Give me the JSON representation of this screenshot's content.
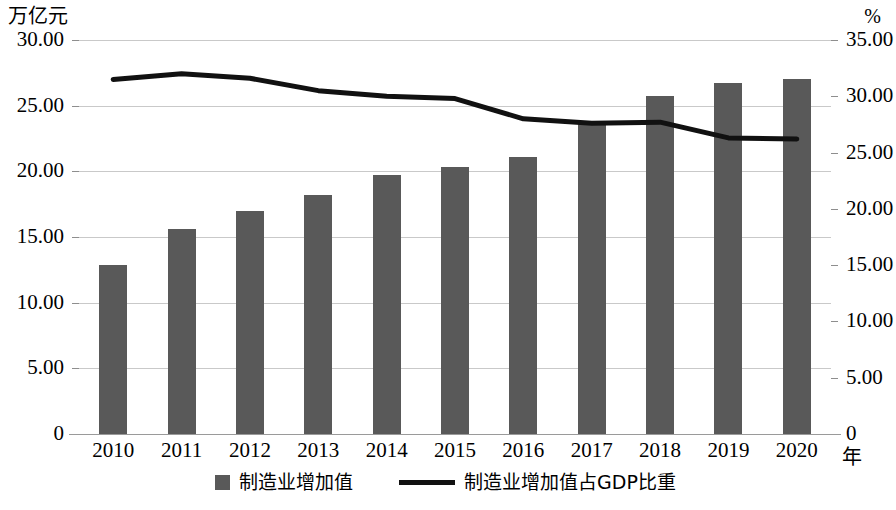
{
  "chart_data": {
    "type": "bar",
    "title": "",
    "subtitle": "",
    "xlabel": "年",
    "ylabel": "万亿元",
    "y2label": "%",
    "categories": [
      "2010",
      "2011",
      "2012",
      "2013",
      "2014",
      "2015",
      "2016",
      "2017",
      "2018",
      "2019",
      "2020"
    ],
    "series": [
      {
        "name": "制造业增加值",
        "type": "bar",
        "axis": "left",
        "unit": "万亿元",
        "color": "#595959",
        "values": [
          12.9,
          15.6,
          17.0,
          18.2,
          19.7,
          20.3,
          21.1,
          23.6,
          25.7,
          26.7,
          27.0
        ]
      },
      {
        "name": "制造业增加值占GDP比重",
        "type": "line",
        "axis": "right",
        "unit": "%",
        "color": "#111111",
        "values": [
          31.5,
          32.0,
          31.6,
          30.5,
          30.0,
          29.8,
          28.0,
          27.6,
          27.7,
          26.3,
          26.2
        ]
      }
    ],
    "ylim": [
      0,
      30
    ],
    "y2lim": [
      0,
      35
    ],
    "yticks": [
      "0",
      "5.00",
      "10.00",
      "15.00",
      "20.00",
      "25.00",
      "30.00"
    ],
    "ytick_values": [
      0,
      5,
      10,
      15,
      20,
      25,
      30
    ],
    "y2ticks": [
      "0",
      "5.00",
      "10.00",
      "15.00",
      "20.00",
      "25.00",
      "30.00",
      "35.00"
    ],
    "y2tick_values": [
      0,
      5,
      10,
      15,
      20,
      25,
      30,
      35
    ],
    "grid": true,
    "legend_position": "bottom"
  },
  "legend": {
    "items": [
      {
        "label": "制造业增加值",
        "marker": "square-swatch",
        "color": "#595959"
      },
      {
        "label": "制造业增加值占GDP比重",
        "marker": "line-swatch",
        "color": "#111111"
      }
    ]
  }
}
